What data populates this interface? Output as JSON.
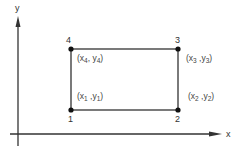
{
  "axes": {
    "x_label": "x",
    "y_label": "y"
  },
  "colors": {
    "line": "#333333",
    "background": "#ffffff"
  },
  "rectangle": {
    "corners": [
      {
        "id": "1",
        "number": "1",
        "x_sym": "x",
        "x_sub": "1",
        "y_sym": "y",
        "y_sub": "1"
      },
      {
        "id": "2",
        "number": "2",
        "x_sym": "x",
        "x_sub": "2",
        "y_sym": "y",
        "y_sub": "2"
      },
      {
        "id": "3",
        "number": "3",
        "x_sym": "x",
        "x_sub": "3",
        "y_sym": "y",
        "y_sub": "3"
      },
      {
        "id": "4",
        "number": "4",
        "x_sym": "x",
        "x_sub": "4",
        "y_sym": "y",
        "y_sub": "4"
      }
    ]
  }
}
